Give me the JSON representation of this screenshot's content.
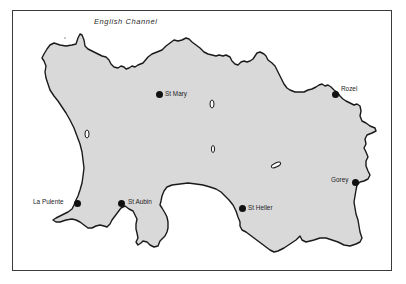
{
  "map": {
    "title": "Jersey",
    "sea_label": "English Channel",
    "colors": {
      "land": "#d9d9d9",
      "coastline": "#1a1a1a",
      "sea": "#ffffff",
      "frame": "#3a3a3a",
      "town_marker": "#111111"
    },
    "places": [
      {
        "name": "St Mary",
        "x": 159,
        "y": 94,
        "label_side": "right"
      },
      {
        "name": "Rozel",
        "x": 336,
        "y": 95,
        "label_side": "right"
      },
      {
        "name": "Gorey",
        "x": 356,
        "y": 183,
        "label_side": "left"
      },
      {
        "name": "La Pulente",
        "x": 77,
        "y": 204,
        "label_side": "left"
      },
      {
        "name": "St Aubin",
        "x": 122,
        "y": 203,
        "label_side": "right"
      },
      {
        "name": "St Heller",
        "x": 243,
        "y": 209,
        "label_side": "right"
      }
    ]
  }
}
